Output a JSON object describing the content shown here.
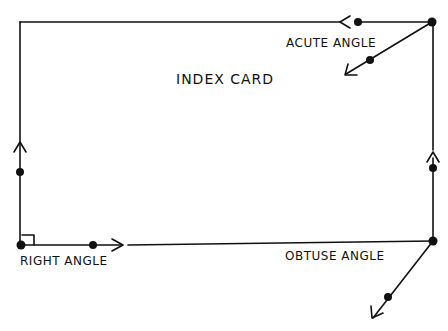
{
  "diagram": {
    "title": "INDEX CARD",
    "labels": {
      "acute": "ACUTE ANGLE",
      "right": "RIGHT ANGLE",
      "obtuse": "OBTUSE ANGLE"
    },
    "colors": {
      "stroke": "#111111",
      "background": "#ffffff"
    },
    "angles": [
      {
        "name": "acute angle",
        "vertex": "top-right corner",
        "rays": [
          "left along top edge",
          "down-left diagonal"
        ]
      },
      {
        "name": "right angle",
        "vertex": "bottom-left corner",
        "rays": [
          "up along left edge",
          "right along bottom edge"
        ]
      },
      {
        "name": "obtuse angle",
        "vertex": "bottom-right corner",
        "rays": [
          "up along right edge",
          "down-left diagonal"
        ]
      }
    ]
  }
}
